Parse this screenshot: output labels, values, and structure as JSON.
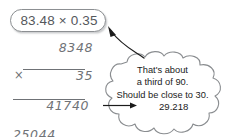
{
  "expression": {
    "text": "83.48 × 0.35"
  },
  "long_multiplication": {
    "multiplicand": "8348",
    "operator": "×",
    "multiplier": "35",
    "partial_product_1": "41740",
    "partial_product_2": "25044",
    "product": "292180"
  },
  "thought_cloud": {
    "line_1": "That's about",
    "line_2": "a third of 90.",
    "line_3": "Should be close to 30.",
    "result": "29.218"
  },
  "colors": {
    "pill_border": "#8c8f92",
    "pill_text": "#55585c",
    "sketch_ink": "#6f7276",
    "cloud_border": "#8a8d90",
    "cloud_text": "#1b1b1b",
    "arrow": "#1b1b1b",
    "background": "#ffffff"
  }
}
